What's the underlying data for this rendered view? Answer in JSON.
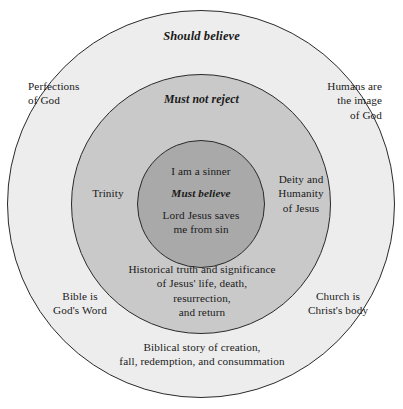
{
  "diagram": {
    "type": "concentric-circles",
    "background_color": "#ffffff",
    "zones": [
      {
        "id": "outer",
        "name": "should-believe",
        "tier_label": "Should believe",
        "fill_color": "#ededed",
        "stroke_color": "#2a2a2a",
        "radius_px": 194
      },
      {
        "id": "middle",
        "name": "must-not-reject",
        "tier_label": "Must not reject",
        "fill_color": "#c9c9c9",
        "stroke_color": "#2a2a2a",
        "radius_px": 130
      },
      {
        "id": "inner",
        "name": "must-believe",
        "tier_label": "Must believe",
        "fill_color": "#a9a9a9",
        "stroke_color": "#2a2a2a",
        "radius_px": 64
      }
    ]
  },
  "inner_zone": {
    "line_top": "I am a sinner",
    "tier_label": "Must believe",
    "line_bottom": "Lord Jesus saves\nme from sin"
  },
  "middle_zone": {
    "tier_label": "Must not reject",
    "left_label": "Trinity",
    "right_label": "Deity and\nHumanity\nof Jesus",
    "bottom_label": "Historical truth and significance\nof Jesus' life, death,\nresurrection,\nand return"
  },
  "outer_zone": {
    "tier_label": "Should believe",
    "top_left_label": "Perfections\nof God",
    "top_right_label": "Humans are\nthe image\nof God",
    "bottom_left_label": "Bible is\nGod's Word",
    "bottom_right_label": "Church is\nChrist's body",
    "bottom_label": "Biblical story of creation,\nfall, redemption, and consummation"
  }
}
